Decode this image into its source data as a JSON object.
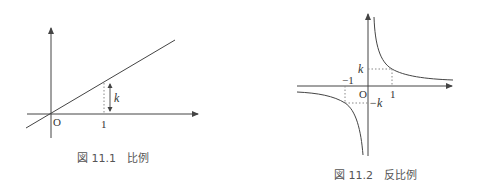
{
  "figures": [
    {
      "id": "fig-11-1",
      "caption": "図 11.1　比例",
      "type": "line",
      "labels": {
        "origin": "O",
        "x_tick": "1",
        "slope": "k"
      }
    },
    {
      "id": "fig-11-2",
      "caption": "図 11.2　反比例",
      "type": "hyperbola",
      "labels": {
        "origin": "O",
        "x_tick_pos": "1",
        "x_tick_neg": "−1",
        "y_tick_pos": "k",
        "y_tick_neg": "−k"
      }
    }
  ],
  "colors": {
    "stroke": "#444444",
    "dotted": "#888888",
    "text": "#333333"
  }
}
